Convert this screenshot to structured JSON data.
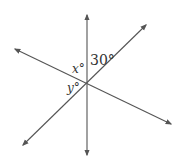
{
  "diagram": {
    "line_color": "#555555",
    "labels": {
      "top_angle": "30°",
      "x_angle": "x°",
      "y_angle": "y°"
    },
    "lines": [
      {
        "name": "vertical-line",
        "x1": 87,
        "y1": 15,
        "x2": 87,
        "y2": 155
      },
      {
        "name": "rising-diagonal-line",
        "x1": 146,
        "y1": 25,
        "x2": 23,
        "y2": 145
      },
      {
        "name": "falling-diagonal-line",
        "x1": 15,
        "y1": 49,
        "x2": 171,
        "y2": 124
      }
    ]
  }
}
